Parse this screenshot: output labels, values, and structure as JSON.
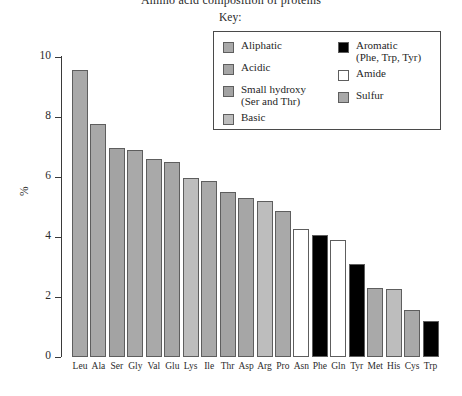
{
  "chart_data": {
    "type": "bar",
    "title": "Amino acid composition of proteins",
    "xlabel": "",
    "ylabel": "%",
    "ylim": [
      0,
      10
    ],
    "yticks": [
      0,
      2,
      4,
      6,
      8,
      10
    ],
    "ytick_labels": [
      "0",
      "2",
      "4",
      "6",
      "8",
      "10"
    ],
    "grid": false,
    "legend_position": "top-right",
    "categories": [
      "Leu",
      "Ala",
      "Ser",
      "Gly",
      "Val",
      "Glu",
      "Lys",
      "Ile",
      "Thr",
      "Asp",
      "Arg",
      "Pro",
      "Asn",
      "Phe",
      "Gln",
      "Tyr",
      "Met",
      "His",
      "Cys",
      "Trp"
    ],
    "values": [
      9.55,
      7.75,
      6.95,
      6.9,
      6.6,
      6.5,
      5.95,
      5.85,
      5.5,
      5.3,
      5.2,
      4.85,
      4.25,
      4.05,
      3.9,
      3.1,
      2.3,
      2.25,
      1.55,
      1.2
    ],
    "bar_groups": [
      "Aliphatic",
      "Aliphatic",
      "Small hydroxy",
      "Aliphatic",
      "Aliphatic",
      "Acidic",
      "Basic",
      "Aliphatic",
      "Small hydroxy",
      "Acidic",
      "Basic",
      "Aliphatic",
      "Amide",
      "Aromatic",
      "Amide",
      "Aromatic",
      "Sulfur",
      "Basic",
      "Sulfur",
      "Aromatic"
    ],
    "bar_colors": [
      "#a9a9a9",
      "#a9a9a9",
      "#a3a3a3",
      "#a9a9a9",
      "#a9a9a9",
      "#a6a6a6",
      "#bdbdbd",
      "#a9a9a9",
      "#a3a3a3",
      "#a6a6a6",
      "#bdbdbd",
      "#a9a9a9",
      "#ffffff",
      "#000000",
      "#ffffff",
      "#000000",
      "#a9a9a9",
      "#bdbdbd",
      "#a9a9a9",
      "#000000"
    ]
  },
  "legend": {
    "caption": "Key:",
    "left_items": [
      {
        "label": "Aliphatic",
        "sub": "",
        "color": "#a9a9a9",
        "swatch_name": "legend-swatch-aliphatic"
      },
      {
        "label": "Acidic",
        "sub": "",
        "color": "#a6a6a6",
        "swatch_name": "legend-swatch-acidic"
      },
      {
        "label": "Small hydroxy",
        "sub": "(Ser and Thr)",
        "color": "#a3a3a3",
        "swatch_name": "legend-swatch-small-hydroxy"
      },
      {
        "label": "Basic",
        "sub": "",
        "color": "#bdbdbd",
        "swatch_name": "legend-swatch-basic"
      }
    ],
    "right_items": [
      {
        "label": "Aromatic",
        "sub": "(Phe, Trp, Tyr)",
        "color": "#000000",
        "swatch_name": "legend-swatch-aromatic"
      },
      {
        "label": "Amide",
        "sub": "",
        "color": "#ffffff",
        "swatch_name": "legend-swatch-amide"
      },
      {
        "label": "Sulfur",
        "sub": "",
        "color": "#a9a9a9",
        "swatch_name": "legend-swatch-sulfur"
      }
    ]
  }
}
